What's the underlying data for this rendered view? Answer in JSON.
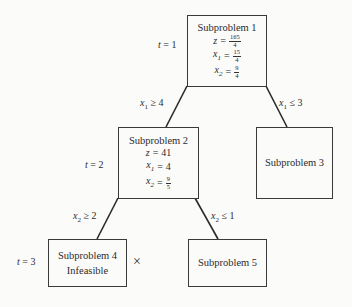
{
  "diagram": {
    "type": "branch-and-bound-tree",
    "nodes": [
      {
        "id": "sp1",
        "title": "Subproblem 1",
        "z_label": "z",
        "z_num": "165",
        "z_den": "4",
        "x1_label": "x",
        "x1_sub": "1",
        "x1_num": "15",
        "x1_den": "4",
        "x2_label": "x",
        "x2_sub": "2",
        "x2_num": "9",
        "x2_den": "4"
      },
      {
        "id": "sp2",
        "title": "Subproblem 2",
        "z_label": "z",
        "z_value": "41",
        "x1_label": "x",
        "x1_sub": "1",
        "x1_value": "4",
        "x2_label": "x",
        "x2_sub": "2",
        "x2_num": "9",
        "x2_den": "5"
      },
      {
        "id": "sp3",
        "title": "Subproblem 3"
      },
      {
        "id": "sp4",
        "title": "Subproblem 4",
        "status": "Infeasible",
        "marker": "×"
      },
      {
        "id": "sp5",
        "title": "Subproblem 5"
      }
    ],
    "edges": [
      {
        "from": "sp1",
        "to": "sp2",
        "var": "x",
        "sub": "1",
        "op": "≥",
        "rhs": "4"
      },
      {
        "from": "sp1",
        "to": "sp3",
        "var": "x",
        "sub": "1",
        "op": "≤",
        "rhs": "3"
      },
      {
        "from": "sp2",
        "to": "sp4",
        "var": "x",
        "sub": "2",
        "op": "≥",
        "rhs": "2"
      },
      {
        "from": "sp2",
        "to": "sp5",
        "var": "x",
        "sub": "2",
        "op": "≤",
        "rhs": "1"
      }
    ],
    "time_labels": [
      {
        "t": "t",
        "eq": "=",
        "value": "1"
      },
      {
        "t": "t",
        "eq": "=",
        "value": "2"
      },
      {
        "t": "t",
        "eq": "=",
        "value": "3"
      }
    ],
    "eq_sign": "="
  }
}
